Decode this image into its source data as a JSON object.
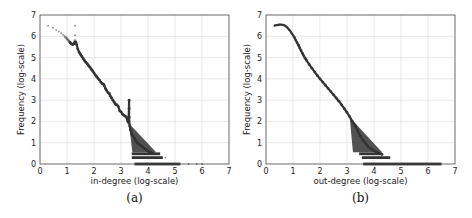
{
  "chart_data": [
    {
      "type": "scatter",
      "panel": "a",
      "caption": "(a)",
      "title": "",
      "xlabel": "in-degree (log-scale)",
      "ylabel": "Frequency (log-scale)",
      "xlim": [
        0,
        7
      ],
      "ylim": [
        0,
        7
      ],
      "xticks": [
        "0",
        "1",
        "2",
        "3",
        "4",
        "5",
        "6",
        "7"
      ],
      "yticks": [
        "0",
        "1",
        "2",
        "3",
        "4",
        "5",
        "6",
        "7"
      ],
      "grid": true,
      "marker_color": "#333333",
      "points": [
        [
          0.3,
          6.5
        ],
        [
          0.48,
          6.4
        ],
        [
          0.6,
          6.3
        ],
        [
          0.7,
          6.22
        ],
        [
          0.78,
          6.15
        ],
        [
          0.85,
          6.08
        ],
        [
          0.9,
          6.02
        ],
        [
          0.95,
          5.95
        ],
        [
          1.0,
          5.88
        ],
        [
          1.04,
          5.82
        ],
        [
          1.08,
          5.76
        ],
        [
          1.12,
          5.7
        ],
        [
          1.16,
          5.65
        ],
        [
          1.2,
          5.62
        ],
        [
          1.23,
          5.62
        ],
        [
          1.26,
          5.66
        ],
        [
          1.28,
          5.72
        ],
        [
          1.3,
          6.5
        ],
        [
          1.3,
          6.05
        ],
        [
          1.3,
          5.8
        ],
        [
          1.33,
          5.72
        ],
        [
          1.36,
          5.6
        ],
        [
          1.4,
          5.4
        ],
        [
          1.45,
          5.25
        ],
        [
          1.5,
          5.15
        ],
        [
          1.55,
          5.05
        ],
        [
          1.6,
          4.95
        ],
        [
          1.65,
          4.86
        ],
        [
          1.7,
          4.78
        ],
        [
          1.75,
          4.7
        ],
        [
          1.8,
          4.62
        ],
        [
          1.85,
          4.55
        ],
        [
          1.9,
          4.45
        ],
        [
          1.95,
          4.37
        ],
        [
          2.0,
          4.28
        ],
        [
          2.05,
          4.18
        ],
        [
          2.1,
          4.1
        ],
        [
          2.15,
          4.02
        ],
        [
          2.2,
          3.95
        ],
        [
          2.25,
          3.85
        ],
        [
          2.3,
          3.78
        ],
        [
          2.35,
          3.75
        ],
        [
          2.38,
          3.68
        ],
        [
          2.42,
          3.55
        ],
        [
          2.47,
          3.45
        ],
        [
          2.52,
          3.35
        ],
        [
          2.57,
          3.3
        ],
        [
          2.6,
          3.2
        ],
        [
          2.65,
          3.1
        ],
        [
          2.7,
          3.0
        ],
        [
          2.75,
          2.9
        ],
        [
          2.8,
          2.8
        ],
        [
          2.85,
          2.78
        ],
        [
          2.9,
          2.7
        ],
        [
          2.95,
          2.5
        ],
        [
          3.0,
          2.45
        ],
        [
          3.05,
          2.35
        ],
        [
          3.1,
          2.3
        ],
        [
          3.15,
          2.25
        ],
        [
          3.2,
          2.2
        ],
        [
          3.25,
          2.0
        ],
        [
          3.28,
          1.95
        ],
        [
          3.3,
          3.0
        ],
        [
          3.3,
          2.6
        ],
        [
          3.3,
          2.2
        ],
        [
          3.32,
          1.8
        ],
        [
          3.35,
          1.6
        ],
        [
          3.4,
          1.4
        ],
        [
          3.45,
          1.3
        ],
        [
          3.5,
          1.2
        ],
        [
          3.55,
          1.1
        ],
        [
          3.6,
          1.0
        ],
        [
          3.65,
          0.95
        ],
        [
          3.7,
          0.9
        ],
        [
          3.75,
          0.85
        ],
        [
          3.8,
          0.8
        ],
        [
          3.85,
          0.75
        ],
        [
          3.9,
          0.7
        ],
        [
          3.95,
          0.65
        ],
        [
          4.0,
          0.6
        ],
        [
          4.1,
          0.55
        ],
        [
          4.2,
          0.5
        ]
      ],
      "floor_bands": [
        {
          "y": 0.48,
          "x_from": 3.4,
          "x_to": 4.45
        },
        {
          "y": 0.3,
          "x_from": 3.4,
          "x_to": 4.55
        },
        {
          "y": 0.0,
          "x_from": 3.5,
          "x_to": 5.2
        }
      ],
      "outliers": [
        [
          4.65,
          0.3
        ],
        [
          5.5,
          0.0
        ],
        [
          5.8,
          0.0
        ],
        [
          6.0,
          0.0
        ]
      ]
    },
    {
      "type": "scatter",
      "panel": "b",
      "caption": "(b)",
      "title": "",
      "xlabel": "out-degree (log-scale)",
      "ylabel": "Frequency (log-scale)",
      "xlim": [
        0,
        7
      ],
      "ylim": [
        0,
        7
      ],
      "xticks": [
        "0",
        "1",
        "2",
        "3",
        "4",
        "5",
        "6",
        "7"
      ],
      "yticks": [
        "0",
        "1",
        "2",
        "3",
        "4",
        "5",
        "6",
        "7"
      ],
      "grid": true,
      "marker_color": "#333333",
      "points": [
        [
          0.3,
          6.5
        ],
        [
          0.4,
          6.52
        ],
        [
          0.48,
          6.55
        ],
        [
          0.55,
          6.55
        ],
        [
          0.62,
          6.54
        ],
        [
          0.7,
          6.5
        ],
        [
          0.78,
          6.42
        ],
        [
          0.85,
          6.32
        ],
        [
          0.9,
          6.25
        ],
        [
          0.95,
          6.15
        ],
        [
          1.0,
          6.05
        ],
        [
          1.05,
          5.95
        ],
        [
          1.1,
          5.82
        ],
        [
          1.15,
          5.7
        ],
        [
          1.2,
          5.58
        ],
        [
          1.25,
          5.45
        ],
        [
          1.3,
          5.32
        ],
        [
          1.35,
          5.2
        ],
        [
          1.4,
          5.08
        ],
        [
          1.45,
          4.97
        ],
        [
          1.5,
          4.87
        ],
        [
          1.6,
          4.68
        ],
        [
          1.7,
          4.5
        ],
        [
          1.8,
          4.33
        ],
        [
          1.9,
          4.16
        ],
        [
          2.0,
          4.0
        ],
        [
          2.1,
          3.85
        ],
        [
          2.2,
          3.7
        ],
        [
          2.3,
          3.55
        ],
        [
          2.4,
          3.4
        ],
        [
          2.5,
          3.25
        ],
        [
          2.6,
          3.1
        ],
        [
          2.7,
          2.95
        ],
        [
          2.8,
          2.78
        ],
        [
          2.9,
          2.6
        ],
        [
          3.0,
          2.42
        ],
        [
          3.1,
          2.22
        ],
        [
          3.2,
          2.0
        ],
        [
          3.3,
          1.8
        ],
        [
          3.4,
          1.55
        ],
        [
          3.5,
          1.3
        ],
        [
          3.6,
          1.1
        ],
        [
          3.7,
          0.95
        ],
        [
          3.8,
          0.8
        ],
        [
          3.9,
          0.7
        ],
        [
          4.0,
          0.62
        ],
        [
          4.1,
          0.55
        ],
        [
          4.2,
          0.5
        ],
        [
          4.3,
          0.45
        ]
      ],
      "floor_bands": [
        {
          "y": 0.48,
          "x_from": 3.45,
          "x_to": 4.3
        },
        {
          "y": 0.3,
          "x_from": 3.55,
          "x_to": 4.6
        },
        {
          "y": 0.0,
          "x_from": 3.6,
          "x_to": 6.5
        }
      ],
      "outliers": []
    }
  ]
}
